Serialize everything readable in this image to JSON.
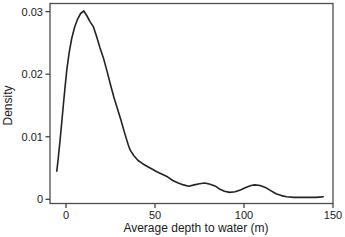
{
  "figure": {
    "background": "#ffffff",
    "frame_color": "#4d4d4d",
    "tick_color": "#333333",
    "text_color": "#1a1a1a"
  },
  "chart_data": {
    "type": "line",
    "title": "",
    "subtitle": "",
    "xlabel": "Average depth to water (m)",
    "ylabel": "Density",
    "xlim": [
      -9,
      150
    ],
    "ylim": [
      -0.00067,
      0.0313
    ],
    "grid": false,
    "legend": "none",
    "x_ticks": {
      "values": [
        0,
        50,
        100,
        150
      ],
      "labels": [
        "0",
        "50",
        "100",
        "150"
      ]
    },
    "y_ticks": {
      "values": [
        0,
        0.01,
        0.02,
        0.03
      ],
      "labels": [
        "0",
        "0.01",
        "0.02",
        "0.03"
      ]
    },
    "series": [
      {
        "name": "density-estimate",
        "color": "#232323",
        "width": 1.6,
        "points": [
          [
            -5.2,
            0.0045
          ],
          [
            -4.4,
            0.0065
          ],
          [
            -3.5,
            0.009
          ],
          [
            -2.5,
            0.012
          ],
          [
            -1.5,
            0.015
          ],
          [
            -0.5,
            0.018
          ],
          [
            0.5,
            0.0208
          ],
          [
            1.8,
            0.0235
          ],
          [
            3.2,
            0.0257
          ],
          [
            4.8,
            0.0275
          ],
          [
            6.5,
            0.0288
          ],
          [
            8.2,
            0.0297
          ],
          [
            10,
            0.0301
          ],
          [
            11.8,
            0.0293
          ],
          [
            13.5,
            0.0284
          ],
          [
            15.3,
            0.0276
          ],
          [
            17,
            0.0262
          ],
          [
            19,
            0.0243
          ],
          [
            21,
            0.0226
          ],
          [
            23,
            0.0205
          ],
          [
            25,
            0.0183
          ],
          [
            27,
            0.0162
          ],
          [
            29,
            0.0144
          ],
          [
            31,
            0.0125
          ],
          [
            33,
            0.0105
          ],
          [
            35,
            0.0087
          ],
          [
            36,
            0.0079
          ],
          [
            38,
            0.007
          ],
          [
            40.5,
            0.0062
          ],
          [
            43,
            0.0057
          ],
          [
            45.5,
            0.0053
          ],
          [
            48,
            0.0049
          ],
          [
            51,
            0.0044
          ],
          [
            54,
            0.004
          ],
          [
            57,
            0.0036
          ],
          [
            60,
            0.003
          ],
          [
            63,
            0.0026
          ],
          [
            66,
            0.0023
          ],
          [
            69,
            0.0021
          ],
          [
            72,
            0.0023
          ],
          [
            75,
            0.0025
          ],
          [
            78,
            0.0026
          ],
          [
            81,
            0.0024
          ],
          [
            84,
            0.0021
          ],
          [
            86.5,
            0.0016
          ],
          [
            89,
            0.0013
          ],
          [
            92,
            0.0011
          ],
          [
            95,
            0.0012
          ],
          [
            98,
            0.0015
          ],
          [
            101,
            0.0019
          ],
          [
            104,
            0.0022
          ],
          [
            106,
            0.0023
          ],
          [
            109,
            0.0022
          ],
          [
            112,
            0.0019
          ],
          [
            115,
            0.0014
          ],
          [
            118,
            0.0009
          ],
          [
            121,
            0.0006
          ],
          [
            124,
            0.0004
          ],
          [
            128,
            0.0003
          ],
          [
            132,
            0.0003
          ],
          [
            136,
            0.0003
          ],
          [
            140,
            0.0003
          ],
          [
            142.5,
            0.00035
          ],
          [
            144.5,
            0.0004
          ]
        ]
      }
    ]
  }
}
